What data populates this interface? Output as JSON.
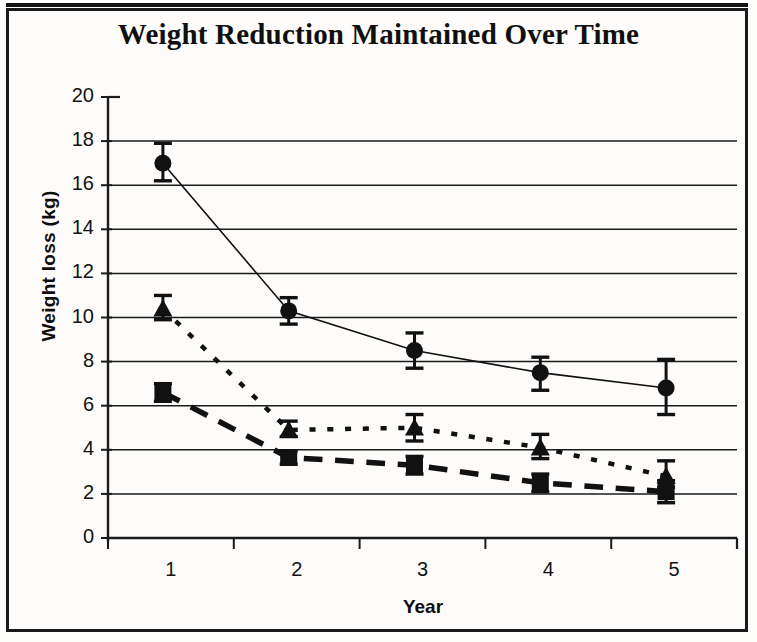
{
  "chart_data": {
    "type": "line",
    "title": "Weight Reduction Maintained Over Time",
    "xlabel": "Year",
    "ylabel": "Weight loss (kg)",
    "categories": [
      "1",
      "2",
      "3",
      "4",
      "5"
    ],
    "x": [
      1,
      2,
      3,
      4,
      5
    ],
    "xlim": [
      0.5,
      5.5
    ],
    "ylim": [
      0,
      20
    ],
    "yticks": [
      0,
      2,
      4,
      6,
      8,
      10,
      12,
      14,
      16,
      18,
      20
    ],
    "ytick_labels": [
      "0",
      "2",
      "4",
      "6",
      "8",
      "10",
      "12",
      "14",
      "16",
      "18",
      "20"
    ],
    "grid": "horizontal",
    "legend": "none",
    "series": [
      {
        "name": "circle-series",
        "marker": "filled-circle",
        "line_style": "solid",
        "line_width": 1.6,
        "color": "#111111",
        "values": [
          17.0,
          10.3,
          8.5,
          7.5,
          6.8
        ],
        "err_low": [
          16.2,
          9.7,
          7.7,
          6.7,
          5.6
        ],
        "err_high": [
          17.9,
          10.9,
          9.3,
          8.2,
          8.1
        ]
      },
      {
        "name": "triangle-series",
        "marker": "filled-triangle",
        "line_style": "dotted",
        "line_width": 4.5,
        "color": "#111111",
        "values": [
          10.4,
          4.9,
          5.0,
          4.1,
          2.8
        ],
        "err_low": [
          9.9,
          4.6,
          4.4,
          3.6,
          2.3
        ],
        "err_high": [
          11.0,
          5.3,
          5.6,
          4.7,
          3.5
        ]
      },
      {
        "name": "square-series",
        "marker": "filled-square",
        "line_style": "dashed",
        "line_width": 5.5,
        "color": "#111111",
        "values": [
          6.6,
          3.65,
          3.3,
          2.5,
          2.1
        ],
        "err_low": [
          6.2,
          3.35,
          2.9,
          2.1,
          1.6
        ],
        "err_high": [
          7.0,
          3.95,
          3.7,
          2.9,
          2.6
        ]
      }
    ]
  },
  "axes": {
    "y_title": "Weight loss (kg)",
    "x_title": "Year"
  },
  "title": "Weight Reduction Maintained Over Time"
}
